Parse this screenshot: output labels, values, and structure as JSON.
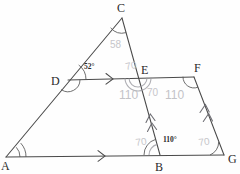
{
  "figure": {
    "stroke_color": "#4a4a4a",
    "pencil_color": "#b9b9be",
    "background": "#fefefe"
  },
  "vertices": [
    {
      "id": "A",
      "label": "A",
      "x": 6,
      "y": 157,
      "lx": 1,
      "ly": 170
    },
    {
      "id": "B",
      "label": "B",
      "x": 160,
      "y": 155,
      "lx": 155,
      "ly": 171
    },
    {
      "id": "C",
      "label": "C",
      "x": 122,
      "y": 18,
      "lx": 117,
      "ly": 12
    },
    {
      "id": "D",
      "label": "D",
      "x": 68,
      "y": 80,
      "lx": 53,
      "ly": 84
    },
    {
      "id": "E",
      "label": "E",
      "x": 138,
      "y": 78,
      "lx": 141,
      "ly": 74
    },
    {
      "id": "F",
      "label": "F",
      "x": 194,
      "y": 77,
      "lx": 195,
      "ly": 72
    },
    {
      "id": "G",
      "label": "G",
      "x": 224,
      "y": 155,
      "lx": 228,
      "ly": 162
    }
  ],
  "segments": [
    {
      "name": "segment-AC",
      "from": "A",
      "to": "C"
    },
    {
      "name": "segment-CB-through-E",
      "from": "C",
      "to": "B"
    },
    {
      "name": "segment-AG-base",
      "from": "A",
      "to": "G"
    },
    {
      "name": "segment-DF-transversal",
      "from": "D",
      "to": "F"
    },
    {
      "name": "segment-FG",
      "from": "F",
      "to": "G"
    }
  ],
  "parallel_marks": [
    {
      "name": "arrow-single-on-DF",
      "on": "segment-DF-transversal",
      "count": 1
    },
    {
      "name": "arrow-single-on-AG",
      "on": "segment-AG-base",
      "count": 1
    },
    {
      "name": "chevron-double-on-EB",
      "on": "segment-CB-through-E",
      "count": 2
    },
    {
      "name": "chevron-double-on-FG",
      "on": "segment-FG",
      "count": 2
    }
  ],
  "printed_angle_labels": [
    {
      "name": "angle-label-D",
      "text": "52°",
      "x": 84,
      "y": 69
    },
    {
      "name": "angle-label-B",
      "text": "110°",
      "x": 163,
      "y": 142
    }
  ],
  "pencil_annotations": [
    {
      "name": "pencil-angle-C",
      "text": "58",
      "x": 110,
      "y": 48
    },
    {
      "name": "pencil-angle-CE",
      "text": "70",
      "x": 126,
      "y": 70
    },
    {
      "name": "pencil-angle-DEB",
      "text": "110",
      "x": 124,
      "y": 99
    },
    {
      "name": "pencil-angle-BEF",
      "text": "70",
      "x": 152,
      "y": 97
    },
    {
      "name": "pencil-angle-EFG",
      "text": "110",
      "x": 170,
      "y": 99
    },
    {
      "name": "pencil-angle-EBA",
      "text": "70",
      "x": 140,
      "y": 146
    },
    {
      "name": "pencil-angle-FGB",
      "text": "70",
      "x": 203,
      "y": 145
    }
  ],
  "angle_arcs": [
    {
      "name": "arc-at-A-outer",
      "vertex": "A",
      "r": 20
    },
    {
      "name": "arc-at-A-inner",
      "vertex": "A",
      "r": 14
    },
    {
      "name": "arc-at-C",
      "vertex": "C",
      "r": 15
    },
    {
      "name": "arc-at-D-outer",
      "vertex": "D",
      "r": 18
    },
    {
      "name": "arc-at-D-inner",
      "vertex": "D",
      "r": 12
    },
    {
      "name": "arc-at-E",
      "vertex": "E",
      "r": 13
    },
    {
      "name": "arc-at-F",
      "vertex": "F",
      "r": 11
    },
    {
      "name": "arc-at-B",
      "vertex": "B",
      "r": 16
    },
    {
      "name": "arc-at-G",
      "vertex": "G",
      "r": 14
    }
  ]
}
